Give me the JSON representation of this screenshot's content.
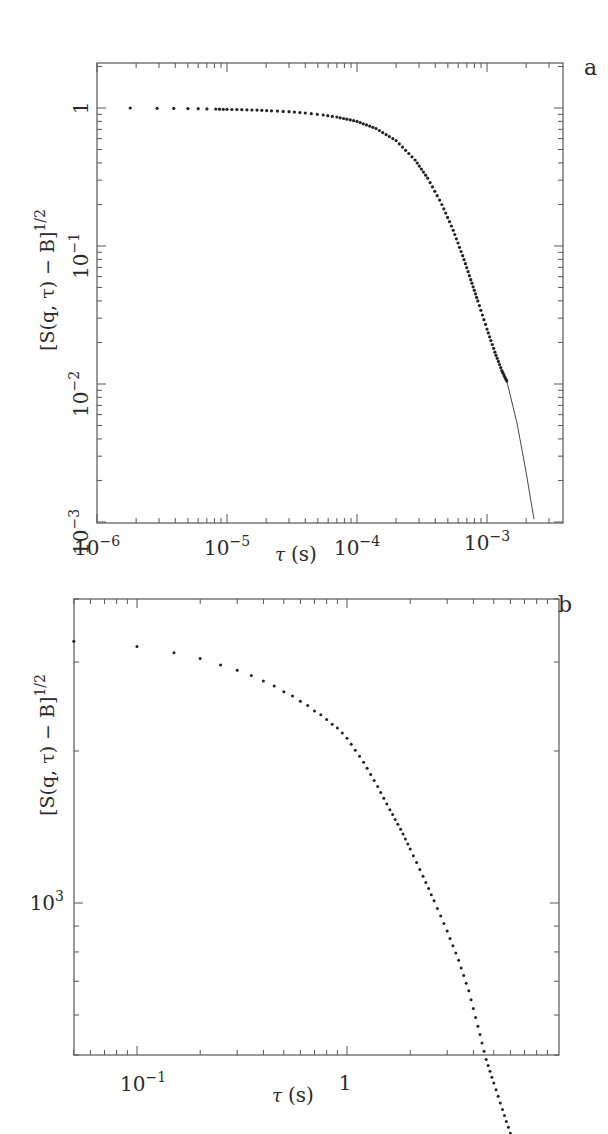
{
  "chart_data": [
    {
      "panel": "a",
      "type": "scatter",
      "title": "",
      "panel_label": "a",
      "xlabel": "τ (s)",
      "ylabel": "[S(q,τ) − B]^{1/2}",
      "xscale": "log",
      "yscale": "log",
      "xlim": [
        1e-06,
        0.0035
      ],
      "ylim": [
        0.001,
        2.1
      ],
      "x_tick_labels": [
        "10^-6",
        "10^-5",
        "10^-4",
        "10^-3"
      ],
      "y_tick_labels": [
        "1",
        "10^-1",
        "10^-2",
        "10^-3"
      ],
      "grid": false,
      "legend": "none",
      "series": [
        {
          "name": "data",
          "style": "points",
          "x": [
            1.8e-06,
            2.9e-06,
            3.9e-06,
            5e-06,
            6e-06,
            7e-06,
            8.2e-06,
            1e-05,
            1.3e-05,
            1.7e-05,
            2.2e-05,
            3e-05,
            4e-05,
            5.5e-05,
            7e-05,
            0.0001,
            0.00014,
            0.0002,
            0.00028,
            0.00035,
            0.00045,
            0.00055,
            0.00065,
            0.00075,
            0.00085,
            0.001,
            0.00115,
            0.0013,
            0.00142
          ],
          "y": [
            1.0,
            0.995,
            0.993,
            0.99,
            0.988,
            0.985,
            0.982,
            0.978,
            0.972,
            0.965,
            0.955,
            0.94,
            0.92,
            0.89,
            0.86,
            0.8,
            0.71,
            0.58,
            0.42,
            0.31,
            0.2,
            0.13,
            0.085,
            0.057,
            0.04,
            0.025,
            0.017,
            0.0125,
            0.0105
          ]
        },
        {
          "name": "fit",
          "style": "line",
          "x": [
            0.00142,
            0.0017,
            0.002,
            0.0023
          ],
          "y": [
            0.0105,
            0.0052,
            0.0023,
            0.00105
          ]
        }
      ]
    },
    {
      "panel": "b",
      "type": "scatter",
      "title": "",
      "panel_label": "b",
      "xlabel": "τ (s)",
      "ylabel": "[S(q,τ) − B]^{1/2}",
      "xscale": "log",
      "yscale": "log",
      "xlim": [
        0.05,
        6.5
      ],
      "ylim": [
        300,
        5000
      ],
      "x_tick_labels": [
        "10^-1",
        "1"
      ],
      "y_tick_labels": [
        "10^3"
      ],
      "grid": false,
      "legend": "none",
      "series": [
        {
          "name": "data",
          "style": "points",
          "x": [
            0.05,
            0.1,
            0.15,
            0.2,
            0.25,
            0.3,
            0.35,
            0.4,
            0.45,
            0.5,
            0.55,
            0.6,
            0.65,
            0.7,
            0.75,
            0.8,
            0.85,
            0.9,
            0.95,
            1.0,
            1.2,
            1.4,
            1.6,
            1.8,
            2.0,
            2.3,
            2.6,
            3.0,
            3.4,
            3.8,
            4.2,
            4.6,
            5.0,
            5.5,
            6.0
          ],
          "y": [
            3300,
            3220,
            3130,
            3050,
            2960,
            2890,
            2820,
            2750,
            2690,
            2620,
            2570,
            2510,
            2460,
            2400,
            2360,
            2310,
            2260,
            2220,
            2170,
            2120,
            1900,
            1700,
            1530,
            1400,
            1280,
            1130,
            1010,
            880,
            770,
            670,
            570,
            490,
            440,
            390,
            350
          ]
        }
      ]
    }
  ],
  "panels": {
    "a": {
      "label": "a",
      "xlabel_tau": "τ",
      "xlabel_unit": "(s)",
      "ylabel_main": "[S(q, τ) − B]",
      "ylabel_exp": "1/2",
      "xticks": [
        {
          "base": "10",
          "exp": "−6"
        },
        {
          "base": "10",
          "exp": "−5"
        },
        {
          "base": "10",
          "exp": "−4"
        },
        {
          "base": "10",
          "exp": "−3"
        }
      ],
      "yticks": [
        {
          "base": "1",
          "exp": ""
        },
        {
          "base": "10",
          "exp": "−1"
        },
        {
          "base": "10",
          "exp": "−2"
        },
        {
          "base": "10",
          "exp": "−3"
        }
      ]
    },
    "b": {
      "label": "b",
      "xlabel_tau": "τ",
      "xlabel_unit": "(s)",
      "ylabel_main": "[S(q, τ) − B]",
      "ylabel_exp": "1/2",
      "xticks": [
        {
          "base": "10",
          "exp": "−1"
        },
        {
          "base": "1",
          "exp": ""
        }
      ],
      "yticks": [
        {
          "base": "10",
          "exp": "3"
        }
      ]
    }
  },
  "colors": {
    "axis": "#555555",
    "data": "#222222",
    "text": "#2a2a2a",
    "background": "#ffffff"
  }
}
